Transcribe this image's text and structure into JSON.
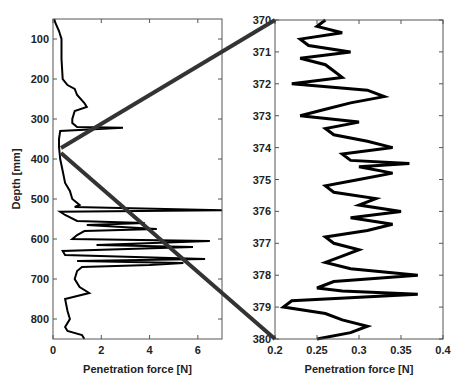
{
  "chart_data": [
    {
      "type": "line",
      "orientation": "depth-profile",
      "title": "",
      "xlabel": "Penetration force [N]",
      "ylabel": "Depth [mm]",
      "xlim": [
        0,
        7
      ],
      "ylim": [
        850,
        50
      ],
      "xticks": [
        0,
        2,
        4,
        6
      ],
      "xtick_labels": [
        "0",
        "2",
        "4",
        "6"
      ],
      "yticks": [
        100,
        200,
        300,
        400,
        500,
        600,
        700,
        800
      ],
      "ytick_labels": [
        "100",
        "200",
        "300",
        "400",
        "500",
        "600",
        "700",
        "800"
      ],
      "grid": false,
      "series": [
        {
          "name": "force profile",
          "depth": [
            50,
            60,
            80,
            100,
            150,
            200,
            215,
            225,
            240,
            260,
            270,
            280,
            300,
            310,
            320,
            322,
            330,
            350,
            370,
            400,
            430,
            460,
            480,
            500,
            515,
            520,
            528,
            532,
            540,
            555,
            560,
            565,
            575,
            580,
            590,
            600,
            605,
            615,
            620,
            630,
            640,
            650,
            655,
            660,
            665,
            670,
            680,
            700,
            720,
            735,
            750,
            780,
            800,
            820,
            830,
            840,
            850
          ],
          "force": [
            0.05,
            0.1,
            0.25,
            0.35,
            0.35,
            0.4,
            0.6,
            0.9,
            1.0,
            1.3,
            1.4,
            0.9,
            0.8,
            0.8,
            1.0,
            2.9,
            0.3,
            0.25,
            0.25,
            0.3,
            0.4,
            0.5,
            0.7,
            0.8,
            1.1,
            0.9,
            7.0,
            0.3,
            0.5,
            1.0,
            3.8,
            1.4,
            4.3,
            1.3,
            1.0,
            0.8,
            6.5,
            1.8,
            5.8,
            0.4,
            0.5,
            6.3,
            1.0,
            5.4,
            4.0,
            1.2,
            1.0,
            0.9,
            1.1,
            1.5,
            0.5,
            0.6,
            0.7,
            0.5,
            0.6,
            1.2,
            1.3
          ]
        }
      ]
    },
    {
      "type": "line",
      "orientation": "depth-profile",
      "title": "",
      "xlabel": "Penetration force [N]",
      "ylabel": "",
      "xlim": [
        0.2,
        0.4
      ],
      "ylim": [
        380,
        370
      ],
      "xticks": [
        0.2,
        0.25,
        0.3,
        0.35,
        0.4
      ],
      "xtick_labels": [
        "0.2",
        "0.25",
        "0.3",
        "0.35",
        "0.4"
      ],
      "yticks": [
        370,
        371,
        372,
        373,
        374,
        375,
        376,
        377,
        378,
        379,
        380
      ],
      "ytick_labels": [
        "370",
        "371",
        "372",
        "373",
        "374",
        "375",
        "376",
        "377",
        "378",
        "379",
        "380"
      ],
      "grid": false,
      "series": [
        {
          "name": "force profile (zoom 370-380 mm)",
          "depth": [
            370.0,
            370.2,
            370.4,
            370.6,
            370.8,
            371.0,
            371.2,
            371.4,
            371.6,
            371.8,
            372.0,
            372.2,
            372.4,
            372.6,
            372.8,
            373.0,
            373.2,
            373.4,
            373.6,
            373.8,
            374.0,
            374.2,
            374.4,
            374.5,
            374.6,
            374.8,
            375.0,
            375.2,
            375.4,
            375.6,
            375.8,
            376.0,
            376.2,
            376.4,
            376.6,
            376.8,
            377.0,
            377.2,
            377.4,
            377.6,
            377.8,
            378.0,
            378.2,
            378.4,
            378.5,
            378.6,
            378.8,
            379.0,
            379.2,
            379.4,
            379.6,
            379.8,
            380.0
          ],
          "force": [
            0.26,
            0.25,
            0.28,
            0.23,
            0.24,
            0.29,
            0.23,
            0.26,
            0.27,
            0.28,
            0.22,
            0.31,
            0.33,
            0.29,
            0.26,
            0.23,
            0.3,
            0.26,
            0.27,
            0.31,
            0.34,
            0.28,
            0.29,
            0.36,
            0.3,
            0.34,
            0.3,
            0.26,
            0.27,
            0.32,
            0.3,
            0.35,
            0.29,
            0.34,
            0.31,
            0.26,
            0.27,
            0.3,
            0.28,
            0.26,
            0.29,
            0.37,
            0.27,
            0.25,
            0.28,
            0.37,
            0.22,
            0.21,
            0.26,
            0.28,
            0.31,
            0.29,
            0.25
          ]
        }
      ]
    }
  ],
  "connector": {
    "from_depth_top": 370,
    "from_depth_bottom": 380,
    "color": "#333333"
  }
}
